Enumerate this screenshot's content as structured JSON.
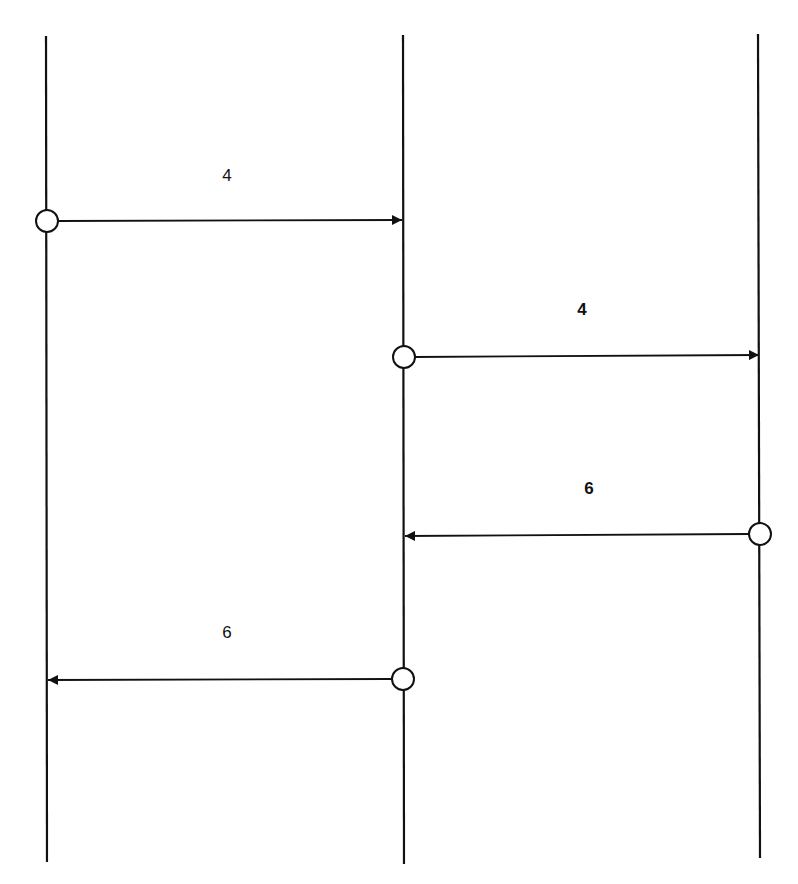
{
  "diagram": {
    "type": "message-sequence",
    "lifelines": [
      {
        "id": "L1",
        "x": 46,
        "y_top": 36,
        "y_bottom": 862
      },
      {
        "id": "L2",
        "x": 403,
        "y_top": 35,
        "y_bottom": 864
      },
      {
        "id": "L3",
        "x": 758,
        "y_top": 34,
        "y_bottom": 858
      }
    ],
    "messages": [
      {
        "label": "4",
        "from": "L1",
        "to": "L2",
        "y": 221,
        "label_x": 226,
        "label_y": 167,
        "bold": false
      },
      {
        "label": "4",
        "from": "L2",
        "to": "L3",
        "y": 356,
        "label_x": 582,
        "label_y": 300,
        "bold": true
      },
      {
        "label": "6",
        "from": "L3",
        "to": "L2",
        "y": 535,
        "label_x": 588,
        "label_y": 480,
        "bold": true
      },
      {
        "label": "6",
        "from": "L2",
        "to": "L1",
        "y": 680,
        "label_x": 227,
        "label_y": 624,
        "bold": false
      }
    ],
    "colors": {
      "line": "#111111",
      "background": "#ffffff"
    }
  },
  "labels": {
    "m1": "4",
    "m2": "4",
    "m3": "6",
    "m4": "6"
  }
}
